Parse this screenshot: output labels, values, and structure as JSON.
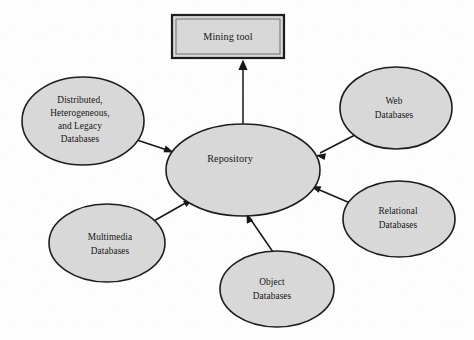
{
  "diagram": {
    "type": "architecture-diagram",
    "background_color": "#fdfdfd",
    "node_fill_color": "#d8d8d8",
    "node_stroke_color": "#1d1d1d",
    "edge_color": "#161616",
    "nodes": [
      {
        "id": "mining-tool",
        "shape": "rectangle",
        "lines": [
          "Mining tool"
        ],
        "x": 172,
        "y": 15,
        "width": 112,
        "height": 43
      },
      {
        "id": "repository",
        "shape": "ellipse",
        "lines": [
          "Repository"
        ],
        "cx": 243,
        "cy": 170,
        "rx": 77,
        "ry": 46
      },
      {
        "id": "distributed-heterogeneous-legacy-databases",
        "shape": "ellipse",
        "lines": [
          "Distributed,",
          "Heterogeneous,",
          "and Legacy",
          "Databases"
        ],
        "cx": 83,
        "cy": 121,
        "rx": 61,
        "ry": 44
      },
      {
        "id": "web-databases",
        "shape": "ellipse",
        "lines": [
          "Web",
          "Databases"
        ],
        "cx": 396,
        "cy": 108,
        "rx": 56,
        "ry": 41
      },
      {
        "id": "relational-databases",
        "shape": "ellipse",
        "lines": [
          "Relational",
          "Databases"
        ],
        "cx": 399,
        "cy": 219,
        "rx": 56,
        "ry": 38
      },
      {
        "id": "multimedia-databases",
        "shape": "ellipse",
        "lines": [
          "Multimedia",
          "Databases"
        ],
        "cx": 107,
        "cy": 243,
        "rx": 58,
        "ry": 39
      },
      {
        "id": "object-databases",
        "shape": "ellipse",
        "lines": [
          "Object",
          "Databases"
        ],
        "cx": 277,
        "cy": 289,
        "rx": 57,
        "ry": 38
      }
    ],
    "edges": [
      {
        "id": "repository-to-mining-tool",
        "from": "repository",
        "to": "mining-tool",
        "x1": 243,
        "y1": 125,
        "x2": 243,
        "y2": 60,
        "arrowhead": "to"
      },
      {
        "id": "distributed-to-repository",
        "from": "distributed-heterogeneous-legacy-databases",
        "to": "repository",
        "x1": 134,
        "y1": 139,
        "x2": 173,
        "y2": 152,
        "arrowhead": "to"
      },
      {
        "id": "web-to-repository",
        "from": "web-databases",
        "to": "repository",
        "x1": 355,
        "y1": 135,
        "x2": 316,
        "y2": 155,
        "arrowhead": "to"
      },
      {
        "id": "relational-to-repository",
        "from": "relational-databases",
        "to": "repository",
        "x1": 350,
        "y1": 203,
        "x2": 312,
        "y2": 186,
        "arrowhead": "to"
      },
      {
        "id": "multimedia-to-repository",
        "from": "multimedia-databases",
        "to": "repository",
        "x1": 152,
        "y1": 222,
        "x2": 192,
        "y2": 199,
        "arrowhead": "to"
      },
      {
        "id": "object-to-repository",
        "from": "object-databases",
        "to": "repository",
        "x1": 273,
        "y1": 252,
        "x2": 247,
        "y2": 212,
        "arrowhead": "to"
      }
    ]
  }
}
